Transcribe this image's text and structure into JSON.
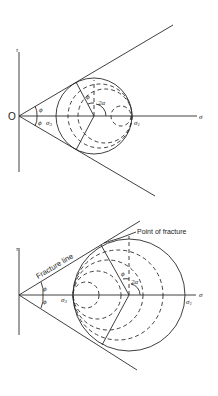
{
  "figures": [
    {
      "id": "mohr-envelope-top",
      "axes": {
        "x_label": "σ",
        "y_label": "τ",
        "origin_label": "O"
      },
      "angle_labels": {
        "upper": "ϕ",
        "lower": "ϕ",
        "friction": "ϕ",
        "double_alpha": "2α"
      },
      "stress_labels": {
        "sigma3": "σ3",
        "sigma1": "σ1"
      }
    },
    {
      "id": "mohr-envelope-bottom",
      "axes": {
        "x_label": "σ",
        "y_label": "τ"
      },
      "angle_labels": {
        "upper": "ϕ",
        "lower": "ϕ",
        "friction": "ϕ",
        "double_alpha": "2α"
      },
      "stress_labels": {
        "sigma3": "σ3",
        "sigma1": "σ1"
      },
      "annotations": {
        "fracture_line": "Fracture line",
        "point_of_fracture": "Point of fracture"
      }
    }
  ]
}
